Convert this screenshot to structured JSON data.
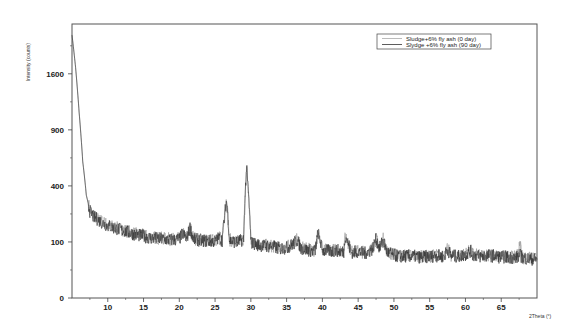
{
  "chart_data": {
    "type": "line",
    "title": "",
    "xlabel": "2Theta (°)",
    "ylabel": "Intensity (counts)",
    "y_scale": "sqrt",
    "xlim": [
      5,
      70
    ],
    "ylim": [
      0,
      2390
    ],
    "grid": false,
    "legend_position": "upper right",
    "x_ticks": [
      10,
      15,
      20,
      25,
      30,
      35,
      40,
      45,
      50,
      55,
      60,
      65
    ],
    "y_ticks": [
      0,
      100,
      400,
      900,
      1600
    ],
    "series": [
      {
        "name": "Sludge+6% fly ash (0 day)",
        "color": "#999999",
        "x": [
          5.0,
          5.5,
          6.0,
          6.5,
          7.0,
          7.5,
          8,
          9,
          10,
          11,
          12,
          13,
          14,
          15,
          16,
          17,
          18,
          19,
          20,
          20.5,
          21,
          21.5,
          22,
          23,
          24,
          25,
          25.5,
          26,
          26.6,
          27,
          28,
          29,
          29.4,
          30,
          31,
          32,
          33,
          34,
          35,
          36,
          36.5,
          37,
          38,
          39,
          39.4,
          40,
          41,
          42,
          43,
          43.2,
          44,
          45,
          46,
          47,
          47.5,
          48,
          48.5,
          49,
          50,
          51,
          52,
          53,
          54,
          55,
          56,
          57,
          57.5,
          58,
          59,
          60,
          60.7,
          61,
          62,
          63,
          64,
          65,
          66,
          67,
          67.7,
          68,
          69,
          70
        ],
        "values": [
          2210,
          1700,
          1100,
          600,
          340,
          245,
          215,
          190,
          170,
          158,
          150,
          140,
          130,
          125,
          118,
          115,
          112,
          110,
          112,
          135,
          112,
          160,
          112,
          108,
          105,
          105,
          118,
          108,
          313,
          108,
          100,
          112,
          547,
          100,
          92,
          88,
          86,
          80,
          82,
          96,
          110,
          80,
          75,
          72,
          140,
          74,
          72,
          74,
          70,
          130,
          68,
          70,
          66,
          78,
          112,
          80,
          110,
          70,
          60,
          56,
          58,
          56,
          54,
          56,
          58,
          56,
          76,
          58,
          56,
          62,
          72,
          62,
          56,
          60,
          58,
          54,
          55,
          52,
          90,
          52,
          50,
          48
        ]
      },
      {
        "name": "Slydge +6% fly ash (90 day)",
        "color": "#333333",
        "x": [
          5.0,
          5.5,
          6.0,
          6.5,
          7.0,
          7.5,
          8,
          9,
          10,
          11,
          12,
          13,
          14,
          15,
          16,
          17,
          18,
          19,
          20,
          20.5,
          21,
          21.5,
          22,
          23,
          24,
          25,
          25.5,
          26,
          26.6,
          27,
          28,
          29,
          29.4,
          30,
          31,
          32,
          33,
          34,
          35,
          36,
          36.5,
          37,
          38,
          39,
          39.4,
          40,
          41,
          42,
          43,
          43.2,
          44,
          45,
          46,
          47,
          47.5,
          48,
          48.5,
          49,
          50,
          51,
          52,
          53,
          54,
          55,
          56,
          57,
          57.5,
          58,
          59,
          60,
          60.7,
          61,
          62,
          63,
          64,
          65,
          66,
          67,
          67.7,
          68,
          69,
          70
        ],
        "values": [
          2200,
          1690,
          1090,
          590,
          335,
          240,
          210,
          186,
          166,
          155,
          146,
          136,
          127,
          122,
          115,
          112,
          109,
          107,
          110,
          132,
          110,
          155,
          110,
          106,
          103,
          103,
          115,
          106,
          305,
          106,
          98,
          110,
          540,
          98,
          90,
          86,
          84,
          78,
          80,
          94,
          108,
          78,
          73,
          70,
          136,
          72,
          70,
          72,
          68,
          126,
          66,
          68,
          64,
          76,
          110,
          78,
          108,
          68,
          58,
          55,
          56,
          55,
          53,
          55,
          57,
          55,
          74,
          56,
          55,
          60,
          70,
          60,
          55,
          58,
          56,
          53,
          54,
          51,
          58,
          51,
          49,
          47
        ]
      }
    ]
  },
  "legend": {
    "items": [
      {
        "label": "Sludge+6% fly ash (0 day)",
        "color": "#aaaaaa"
      },
      {
        "label": "Slydge +6% fly ash (90 day)",
        "color": "#333333"
      }
    ]
  },
  "axes": {
    "ylabel": "Intensity (counts)",
    "xlabel": "2Theta (°)"
  }
}
